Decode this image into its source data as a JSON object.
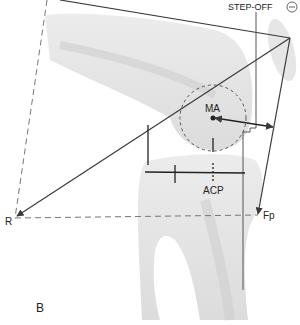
{
  "figure": {
    "panel_label": "B",
    "labels": {
      "step_off": "STEP-OFF",
      "step_off_sign": "−",
      "ma": "MA",
      "acp": "ACP",
      "r": "R",
      "fp": "Fp"
    },
    "colors": {
      "line": "#3a3a3a",
      "dashed": "#777777",
      "bone": "#e4e4e4",
      "bone_shadow": "#cfcfcf",
      "background": "#ffffff"
    }
  }
}
